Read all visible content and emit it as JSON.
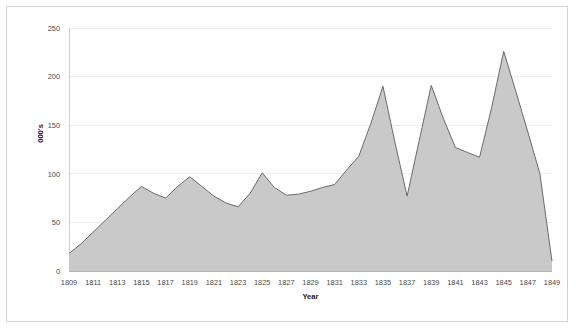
{
  "chart_data": {
    "type": "area",
    "title": "",
    "xlabel": "Year",
    "ylabel": "000's",
    "xlim": [
      1809,
      1849
    ],
    "ylim": [
      0,
      250
    ],
    "ytick_step": 50,
    "yticks": [
      0,
      50,
      100,
      150,
      200,
      250
    ],
    "xticks": [
      1809,
      1811,
      1813,
      1815,
      1817,
      1819,
      1821,
      1823,
      1825,
      1827,
      1829,
      1831,
      1833,
      1835,
      1837,
      1839,
      1841,
      1843,
      1845,
      1847,
      1849
    ],
    "grid": true,
    "legend": false,
    "x": [
      1809,
      1810,
      1811,
      1812,
      1813,
      1814,
      1815,
      1816,
      1817,
      1818,
      1819,
      1820,
      1821,
      1822,
      1823,
      1824,
      1825,
      1826,
      1827,
      1828,
      1829,
      1830,
      1831,
      1832,
      1833,
      1834,
      1835,
      1836,
      1837,
      1838,
      1839,
      1840,
      1841,
      1842,
      1843,
      1844,
      1845,
      1846,
      1847,
      1848,
      1849
    ],
    "values": [
      18,
      28,
      40,
      52,
      64,
      76,
      87,
      80,
      75,
      87,
      97,
      87,
      77,
      70,
      66,
      80,
      101,
      86,
      78,
      79,
      82,
      86,
      89,
      104,
      118,
      152,
      190,
      132,
      77,
      134,
      191,
      157,
      127,
      122,
      117,
      168,
      226,
      185,
      143,
      100,
      10
    ],
    "series": [
      {
        "name": "000's",
        "values": [
          18,
          28,
          40,
          52,
          64,
          76,
          87,
          80,
          75,
          87,
          97,
          87,
          77,
          70,
          66,
          80,
          101,
          86,
          78,
          79,
          82,
          86,
          89,
          104,
          118,
          152,
          190,
          132,
          77,
          134,
          191,
          157,
          127,
          122,
          117,
          168,
          226,
          185,
          143,
          100,
          10
        ],
        "fill_color": "#c9c9c9",
        "line_color": "#6b6b6b"
      }
    ],
    "colors": {
      "background": "#ffffff",
      "border": "#d2d2d2",
      "grid": "#ededed",
      "axis": "#cfcfcf",
      "baseline": "#b4b4b4",
      "fill": "#c9c9c9",
      "stroke": "#6b6b6b",
      "text": "#4a4a4a"
    }
  },
  "xtick_labels": [
    "1809",
    "1811",
    "1813",
    "1815",
    "1817",
    "1819",
    "1821",
    "1823",
    "1825",
    "1827",
    "1829",
    "1831",
    "1833",
    "1835",
    "1837",
    "1839",
    "1841",
    "1843",
    "1845",
    "1847",
    "1849"
  ],
  "ytick_labels": [
    "0",
    "50",
    "100",
    "150",
    "200",
    "250"
  ],
  "axis_titles": {
    "x": "Year",
    "y": "000's"
  }
}
